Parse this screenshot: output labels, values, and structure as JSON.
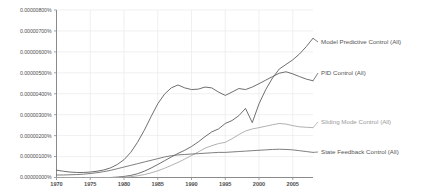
{
  "chart_data": {
    "type": "line",
    "title": "",
    "subtitle": "",
    "xlabel": "",
    "ylabel": "",
    "grid": true,
    "legend_position": "right-inline-labels",
    "xlim": [
      1970,
      2008
    ],
    "ylim": [
      0.0,
      8e-06
    ],
    "x_ticks": [
      1970,
      1975,
      1980,
      1985,
      1990,
      1995,
      2000,
      2005
    ],
    "x_tick_labels": [
      "1970",
      "1975",
      "1980",
      "1985",
      "1990",
      "1995",
      "2000",
      "2005"
    ],
    "y_ticks": [
      0.0,
      1e-06,
      2e-06,
      3e-06,
      4e-06,
      5e-06,
      6e-06,
      7e-06,
      8e-06
    ],
    "y_tick_labels": [
      "0.00000000%",
      "0.00000100%",
      "0.00000200%",
      "0.00000300%",
      "0.00000400%",
      "0.00000500%",
      "0.00000600%",
      "0.00000700%",
      "0.00000800%"
    ],
    "x": [
      1970,
      1971,
      1972,
      1973,
      1974,
      1975,
      1976,
      1977,
      1978,
      1979,
      1980,
      1981,
      1982,
      1983,
      1984,
      1985,
      1986,
      1987,
      1988,
      1989,
      1990,
      1991,
      1992,
      1993,
      1994,
      1995,
      1996,
      1997,
      1998,
      1999,
      2000,
      2001,
      2002,
      2003,
      2004,
      2005,
      2006,
      2007,
      2008
    ],
    "series": [
      {
        "name": "Model Predictive Control (All)",
        "label": "Model Predictive Control (All)",
        "color": "#5f5f5f",
        "label_color": "#555555",
        "values": [
          0.0,
          0.0,
          0.0,
          0.0,
          0.0,
          0.0,
          0.0,
          0.0,
          0.0,
          2e-08,
          5e-08,
          1e-07,
          1.8e-07,
          3e-07,
          4.5e-07,
          6.2e-07,
          8e-07,
          9.8e-07,
          1.15e-06,
          1.3e-06,
          1.48e-06,
          1.7e-06,
          1.95e-06,
          2.18e-06,
          2.32e-06,
          2.58e-06,
          2.72e-06,
          2.95e-06,
          3.3e-06,
          2.62e-06,
          3.52e-06,
          4.2e-06,
          4.75e-06,
          5.18e-06,
          5.4e-06,
          5.62e-06,
          5.9e-06,
          6.25e-06,
          6.65e-06
        ]
      },
      {
        "name": "PID Control (All)",
        "label": "PID Control (All)",
        "color": "#5f5f5f",
        "label_color": "#555555",
        "values": [
          3.5e-07,
          3e-07,
          2.6e-07,
          2.4e-07,
          2.4e-07,
          2.6e-07,
          3e-07,
          3.6e-07,
          4.6e-07,
          6.2e-07,
          8.5e-07,
          1.2e-06,
          1.68e-06,
          2.25e-06,
          2.9e-06,
          3.52e-06,
          3.98e-06,
          4.28e-06,
          4.42e-06,
          4.28e-06,
          4.2e-06,
          4.22e-06,
          4.32e-06,
          4.28e-06,
          4.08e-06,
          3.92e-06,
          4.08e-06,
          4.25e-06,
          4.2e-06,
          4.32e-06,
          4.48e-06,
          4.65e-06,
          4.82e-06,
          4.98e-06,
          5.05e-06,
          4.95e-06,
          4.82e-06,
          4.7e-06,
          4.62e-06
        ]
      },
      {
        "name": "Sliding Mode Control (All)",
        "label": "Sliding Mode Control (All)",
        "color": "#a8a8a8",
        "label_color": "#9a9a9a",
        "values": [
          0.0,
          0.0,
          0.0,
          0.0,
          0.0,
          0.0,
          0.0,
          0.0,
          0.0,
          0.0,
          2e-08,
          4e-08,
          8e-08,
          1.4e-07,
          2.2e-07,
          3.2e-07,
          4.4e-07,
          5.8e-07,
          7.2e-07,
          8.8e-07,
          1.05e-06,
          1.22e-06,
          1.4e-06,
          1.52e-06,
          1.62e-06,
          1.68e-06,
          1.85e-06,
          2.05e-06,
          2.22e-06,
          2.32e-06,
          2.38e-06,
          2.45e-06,
          2.52e-06,
          2.58e-06,
          2.55e-06,
          2.48e-06,
          2.42e-06,
          2.4e-06,
          2.38e-06
        ]
      },
      {
        "name": "State Feedback Control (All)",
        "label": "State Feedback Control (All)",
        "color": "#6f6f6f",
        "label_color": "#555555",
        "values": [
          1.2e-07,
          1.2e-07,
          1.3e-07,
          1.4e-07,
          1.6e-07,
          1.9e-07,
          2.3e-07,
          2.8e-07,
          3.4e-07,
          4.2e-07,
          5e-07,
          5.8e-07,
          6.6e-07,
          7.4e-07,
          8.2e-07,
          9e-07,
          9.8e-07,
          1.04e-06,
          1.08e-06,
          1.1e-06,
          1.12e-06,
          1.14e-06,
          1.16e-06,
          1.18e-06,
          1.2e-06,
          1.2e-06,
          1.22e-06,
          1.24e-06,
          1.26e-06,
          1.28e-06,
          1.3e-06,
          1.32e-06,
          1.34e-06,
          1.35e-06,
          1.34e-06,
          1.32e-06,
          1.28e-06,
          1.24e-06,
          1.2e-06
        ]
      }
    ],
    "annotations": []
  },
  "footer": {
    "smudge_text": ""
  }
}
